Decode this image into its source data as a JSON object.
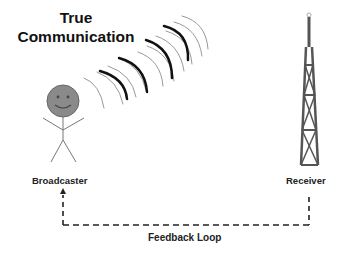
{
  "title": {
    "line1": "True",
    "line2": "Communication"
  },
  "nodes": {
    "broadcaster": {
      "label": "Broadcaster",
      "icon": "stick-figure-smiley"
    },
    "receiver": {
      "label": "Receiver",
      "icon": "radio-tower"
    }
  },
  "feedback": {
    "label": "Feedback Loop",
    "style": "dashed",
    "direction": "receiver-to-broadcaster"
  },
  "signal": {
    "icon": "radio-wave-arcs",
    "groups": 4
  },
  "colors": {
    "text": "#111111",
    "face": "#8a8a8a",
    "tower": "#555555",
    "wave_dark": "#111111",
    "wave_light": "#888888",
    "line": "#222222"
  }
}
